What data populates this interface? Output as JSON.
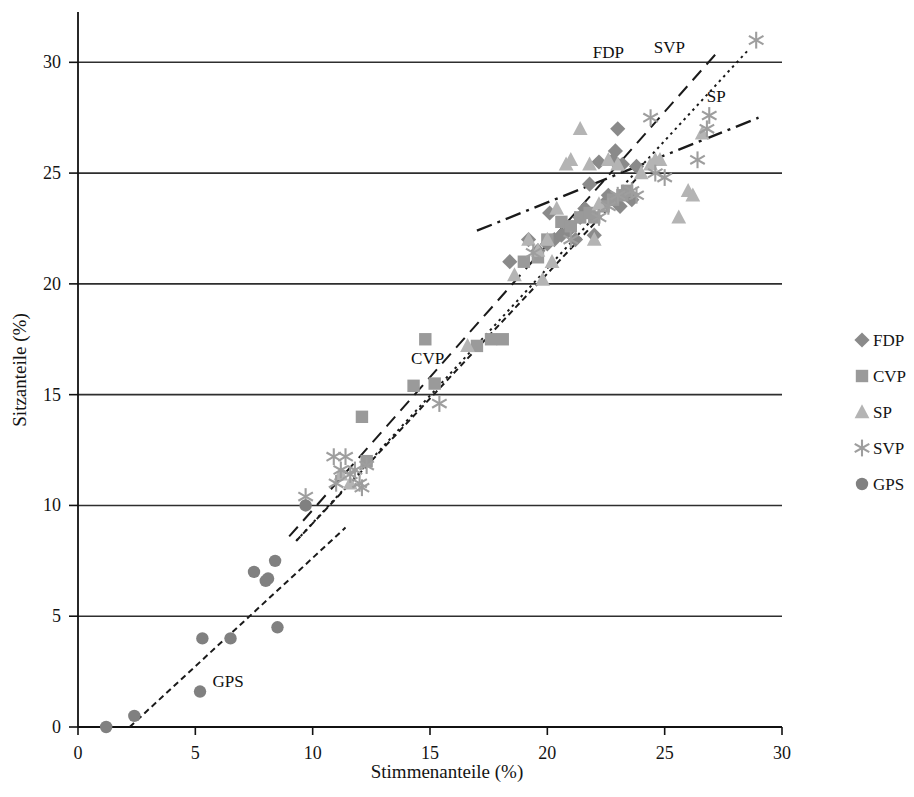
{
  "chart_data": {
    "type": "scatter",
    "title": "",
    "xlabel": "Stimmenanteile (%)",
    "ylabel": "Sitzanteile (%)",
    "xlim": [
      0,
      30
    ],
    "ylim": [
      0,
      32
    ],
    "xticks": [
      0,
      5,
      10,
      15,
      20,
      25,
      30
    ],
    "yticks": [
      0,
      5,
      10,
      15,
      20,
      25,
      30
    ],
    "grid": "horizontal",
    "legend_position": "right",
    "series": [
      {
        "name": "FDP",
        "marker": "diamond",
        "color": "#8a8a8a",
        "points": [
          [
            19.6,
            21.5
          ],
          [
            20.0,
            21.8
          ],
          [
            20.3,
            22.0
          ],
          [
            20.6,
            22.2
          ],
          [
            20.9,
            22.4
          ],
          [
            21.2,
            22.0
          ],
          [
            21.4,
            23.0
          ],
          [
            21.6,
            23.4
          ],
          [
            21.8,
            24.5
          ],
          [
            22.0,
            22.2
          ],
          [
            22.2,
            25.5
          ],
          [
            22.4,
            23.6
          ],
          [
            22.6,
            24.0
          ],
          [
            22.8,
            25.6
          ],
          [
            23.0,
            27.0
          ],
          [
            23.2,
            25.4
          ],
          [
            23.4,
            24.0
          ],
          [
            23.6,
            23.8
          ],
          [
            23.8,
            25.3
          ],
          [
            19.2,
            22.0
          ],
          [
            18.4,
            21.0
          ],
          [
            20.1,
            23.2
          ],
          [
            22.9,
            26.0
          ],
          [
            23.1,
            23.5
          ]
        ]
      },
      {
        "name": "CVP",
        "marker": "square",
        "color": "#9a9a9a",
        "points": [
          [
            12.1,
            14.0
          ],
          [
            12.3,
            12.0
          ],
          [
            14.3,
            15.4
          ],
          [
            14.8,
            17.5
          ],
          [
            15.2,
            15.5
          ],
          [
            17.0,
            17.2
          ],
          [
            17.6,
            17.5
          ],
          [
            18.1,
            17.5
          ],
          [
            19.6,
            21.2
          ],
          [
            20.6,
            22.8
          ],
          [
            21.0,
            22.6
          ],
          [
            21.4,
            23.0
          ],
          [
            22.0,
            23.0
          ],
          [
            22.4,
            23.5
          ],
          [
            22.8,
            23.8
          ],
          [
            23.2,
            24.0
          ],
          [
            23.4,
            24.2
          ],
          [
            19.0,
            21.0
          ],
          [
            20.0,
            22.0
          ],
          [
            21.8,
            23.2
          ]
        ]
      },
      {
        "name": "SP",
        "marker": "triangle",
        "color": "#b4b4b4",
        "points": [
          [
            11.2,
            11.4
          ],
          [
            11.6,
            11.0
          ],
          [
            16.6,
            17.2
          ],
          [
            19.6,
            21.5
          ],
          [
            19.8,
            20.2
          ],
          [
            20.0,
            22.0
          ],
          [
            20.4,
            23.4
          ],
          [
            20.8,
            25.4
          ],
          [
            21.0,
            25.6
          ],
          [
            21.4,
            27.0
          ],
          [
            21.8,
            25.4
          ],
          [
            22.2,
            23.6
          ],
          [
            22.6,
            25.6
          ],
          [
            23.0,
            25.4
          ],
          [
            24.0,
            25.0
          ],
          [
            24.4,
            25.4
          ],
          [
            24.8,
            25.6
          ],
          [
            25.6,
            23.0
          ],
          [
            26.0,
            24.2
          ],
          [
            26.2,
            24.0
          ],
          [
            26.6,
            26.8
          ],
          [
            18.6,
            20.4
          ],
          [
            19.2,
            22.0
          ],
          [
            20.2,
            21.0
          ],
          [
            22.0,
            22.0
          ],
          [
            24.6,
            25.6
          ]
        ]
      },
      {
        "name": "SVP",
        "marker": "asterisk",
        "color": "#9e9e9e",
        "points": [
          [
            9.7,
            10.4
          ],
          [
            10.9,
            12.2
          ],
          [
            11.2,
            11.6
          ],
          [
            11.4,
            12.2
          ],
          [
            11.6,
            11.4
          ],
          [
            11.8,
            11.6
          ],
          [
            12.0,
            11.0
          ],
          [
            12.1,
            10.8
          ],
          [
            12.3,
            11.8
          ],
          [
            11.0,
            11.0
          ],
          [
            15.4,
            14.6
          ],
          [
            19.4,
            21.4
          ],
          [
            21.0,
            22.0
          ],
          [
            22.2,
            23.0
          ],
          [
            22.6,
            23.5
          ],
          [
            23.0,
            24.0
          ],
          [
            23.6,
            24.2
          ],
          [
            23.8,
            24.0
          ],
          [
            24.6,
            25.0
          ],
          [
            25.0,
            24.8
          ],
          [
            26.4,
            25.6
          ],
          [
            26.8,
            27.0
          ],
          [
            26.9,
            27.6
          ],
          [
            28.9,
            31.0
          ],
          [
            24.4,
            27.5
          ]
        ]
      },
      {
        "name": "GPS",
        "marker": "circle",
        "color": "#808080",
        "points": [
          [
            1.2,
            0.0
          ],
          [
            2.4,
            0.5
          ],
          [
            5.2,
            1.6
          ],
          [
            5.3,
            4.0
          ],
          [
            6.5,
            4.0
          ],
          [
            7.5,
            7.0
          ],
          [
            8.0,
            6.6
          ],
          [
            8.1,
            6.7
          ],
          [
            8.4,
            7.5
          ],
          [
            8.5,
            4.5
          ],
          [
            9.7,
            10.0
          ]
        ]
      }
    ],
    "trendlines": [
      {
        "name": "FDP",
        "style": "dashed",
        "x0": 9.0,
        "y0": 8.6,
        "x1": 27.2,
        "y1": 30.4
      },
      {
        "name": "SVP",
        "style": "dotted",
        "x0": 9.3,
        "y0": 8.4,
        "x1": 28.6,
        "y1": 30.6
      },
      {
        "name": "SP",
        "style": "dashdot",
        "x0": 17.0,
        "y0": 22.4,
        "x1": 29.0,
        "y1": 27.5
      },
      {
        "name": "CVP",
        "style": "dashed-fine",
        "x0": 9.3,
        "y0": 8.4,
        "x1": 24.2,
        "y1": 25.2
      },
      {
        "name": "GPS",
        "style": "dashed-fine",
        "x0": 2.2,
        "y0": 0.0,
        "x1": 11.4,
        "y1": 9.0
      }
    ],
    "annotations": [
      {
        "text": "FDP",
        "x": 22.6,
        "y": 30.2
      },
      {
        "text": "SVP",
        "x": 25.2,
        "y": 30.4
      },
      {
        "text": "SP",
        "x": 27.2,
        "y": 28.2
      },
      {
        "text": "CVP",
        "x": 14.9,
        "y": 16.4
      },
      {
        "text": "GPS",
        "x": 6.4,
        "y": 1.8
      }
    ]
  },
  "legend": {
    "items": [
      {
        "label": "FDP",
        "marker": "diamond",
        "color": "#8a8a8a"
      },
      {
        "label": "CVP",
        "marker": "square",
        "color": "#9a9a9a"
      },
      {
        "label": "SP",
        "marker": "triangle",
        "color": "#b4b4b4"
      },
      {
        "label": "SVP",
        "marker": "asterisk",
        "color": "#9e9e9e"
      },
      {
        "label": "GPS",
        "marker": "circle",
        "color": "#808080"
      }
    ]
  }
}
